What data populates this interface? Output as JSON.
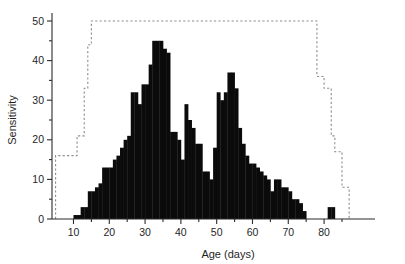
{
  "chart_data": {
    "type": "bar",
    "title": "",
    "subtitle": "",
    "xlabel": "Age (days)",
    "ylabel": "Sensitivity",
    "xlim": [
      4,
      88
    ],
    "ylim": [
      0,
      52
    ],
    "grid": false,
    "legend": null,
    "xticks": [
      10,
      20,
      30,
      40,
      50,
      60,
      70,
      80
    ],
    "xticklabels": [
      "10",
      "20",
      "30",
      "40",
      "50",
      "60",
      "70",
      "80"
    ],
    "xminorticks": [
      15,
      25,
      35,
      45,
      55,
      65,
      75,
      85
    ],
    "yticks": [
      0,
      10,
      20,
      30,
      40,
      50
    ],
    "yticklabels": [
      "0",
      "10",
      "20",
      "30",
      "40",
      "50"
    ],
    "yminorticks": [
      5,
      15,
      25,
      35,
      45
    ],
    "bar_width": 1,
    "categories": [
      10,
      11,
      12,
      13,
      14,
      15,
      16,
      17,
      18,
      19,
      20,
      21,
      22,
      23,
      24,
      25,
      26,
      27,
      28,
      29,
      30,
      31,
      32,
      33,
      34,
      35,
      36,
      37,
      38,
      39,
      40,
      41,
      42,
      43,
      44,
      45,
      46,
      47,
      48,
      49,
      50,
      51,
      52,
      53,
      54,
      55,
      56,
      57,
      58,
      59,
      60,
      61,
      62,
      63,
      64,
      65,
      66,
      67,
      68,
      69,
      70,
      71,
      72,
      73,
      74,
      75,
      76,
      77,
      78,
      79,
      80,
      81,
      82,
      83,
      84,
      85
    ],
    "values": [
      1,
      1,
      3,
      3,
      7,
      7,
      8,
      9,
      13,
      13,
      13,
      15,
      16,
      18,
      20,
      21,
      32,
      32,
      29,
      34,
      34,
      39,
      45,
      45,
      45,
      43,
      42,
      22,
      22,
      20,
      15,
      29,
      25,
      23,
      19,
      19,
      12,
      12,
      10,
      18,
      32,
      30,
      32,
      37,
      37,
      33,
      23,
      19,
      16,
      14,
      14,
      13,
      12,
      11,
      10,
      7,
      10,
      10,
      8,
      8,
      7,
      5,
      5,
      4,
      2,
      0,
      0,
      0,
      0,
      0,
      0,
      3,
      3,
      0,
      0,
      0
    ],
    "envelope": {
      "name": "upper-limit step line",
      "style": "dashed",
      "color": "#8d8d8d",
      "x": [
        5,
        5,
        11,
        11,
        13,
        13,
        14,
        14,
        15,
        15,
        78,
        78,
        80,
        80,
        82,
        82,
        83,
        83,
        85,
        85,
        87,
        87
      ],
      "y": [
        0,
        16,
        16,
        21,
        21,
        33,
        33,
        44,
        44,
        50,
        50,
        36,
        36,
        33,
        33,
        21,
        21,
        17,
        17,
        8,
        8,
        0
      ]
    }
  },
  "figure": {
    "ylabel": "Sensitivity",
    "xlabel": "Age (days)"
  }
}
